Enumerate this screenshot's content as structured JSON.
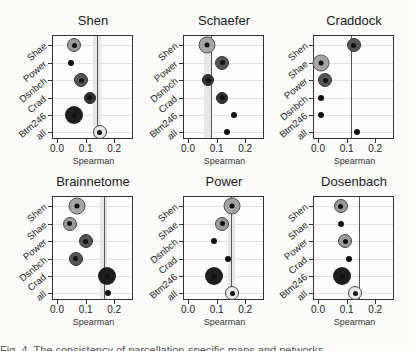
{
  "chart_data": [
    {
      "type": "scatter",
      "title": "Shen",
      "xlabel": "Spearman",
      "xlim": [
        -0.01,
        0.27
      ],
      "xticks": [
        "0.0",
        "0.1",
        "0.2"
      ],
      "categories": [
        "Shae",
        "Power",
        "Dsnbch",
        "Crad",
        "Btm246",
        "all"
      ],
      "values": [
        0.06,
        0.05,
        0.085,
        0.115,
        0.06,
        0.15
      ],
      "markers": [
        "ring",
        "small",
        "ringdark",
        "darkmed",
        "darklg",
        "open"
      ],
      "reference_line": 0.14,
      "band": [
        0.125,
        0.155
      ]
    },
    {
      "type": "scatter",
      "title": "Schaefer",
      "xlabel": "Spearman",
      "xlim": [
        -0.01,
        0.27
      ],
      "xticks": [
        "0.0",
        "0.1",
        "0.2"
      ],
      "categories": [
        "Shen",
        "Power",
        "Dsnbch",
        "Crad",
        "Btm246",
        "all"
      ],
      "values": [
        0.065,
        0.12,
        0.07,
        0.12,
        0.16,
        0.135
      ],
      "markers": [
        "ringbig",
        "ringdark",
        "darkmed",
        "darkmed",
        "small",
        "small"
      ],
      "reference_line": 0.08,
      "band": [
        0.055,
        0.08
      ]
    },
    {
      "type": "scatter",
      "title": "Craddock",
      "xlabel": "Spearman",
      "xlim": [
        -0.01,
        0.27
      ],
      "xticks": [
        "0.0",
        "0.1",
        "0.2"
      ],
      "categories": [
        "Shen",
        "Shae",
        "Power",
        "Dsnbch",
        "Btm246",
        "all"
      ],
      "values": [
        0.125,
        0.01,
        0.025,
        0.01,
        0.01,
        0.135
      ],
      "markers": [
        "ringdark",
        "ringbig",
        "ringdark",
        "small",
        "small",
        "small"
      ],
      "reference_line": 0.115,
      "band": null
    },
    {
      "type": "scatter",
      "title": "Brainnetome",
      "xlabel": "Spearman",
      "xlim": [
        -0.01,
        0.27
      ],
      "xticks": [
        "0.0",
        "0.1",
        "0.2"
      ],
      "categories": [
        "Shen",
        "Shae",
        "Power",
        "Dsnbch",
        "Crad",
        "all"
      ],
      "values": [
        0.07,
        0.045,
        0.1,
        0.065,
        0.175,
        0.18
      ],
      "markers": [
        "ringbig",
        "ring",
        "ringdark",
        "ringdark",
        "darklg",
        "small"
      ],
      "reference_line": 0.165,
      "band": [
        0.15,
        0.175
      ]
    },
    {
      "type": "scatter",
      "title": "Power",
      "xlabel": "Spearman",
      "xlim": [
        -0.01,
        0.27
      ],
      "xticks": [
        "0.0",
        "0.1",
        "0.2"
      ],
      "categories": [
        "Shen",
        "Shae",
        "Dsnbch",
        "Crad",
        "Btm246",
        "all"
      ],
      "values": [
        0.155,
        0.12,
        0.09,
        0.14,
        0.09,
        0.155
      ],
      "markers": [
        "ringbig",
        "ring",
        "small",
        "small",
        "darklg",
        "open"
      ],
      "reference_line": 0.15,
      "band": [
        0.14,
        0.165
      ]
    },
    {
      "type": "scatter",
      "title": "Dosenbach",
      "xlabel": "Spearman",
      "xlim": [
        -0.01,
        0.27
      ],
      "xticks": [
        "0.0",
        "0.1",
        "0.2"
      ],
      "categories": [
        "Shen",
        "Shae",
        "Power",
        "Crad",
        "Btm246",
        "all"
      ],
      "values": [
        0.08,
        0.08,
        0.095,
        0.11,
        0.085,
        0.13
      ],
      "markers": [
        "ring",
        "small",
        "ring",
        "small",
        "darklg",
        "open"
      ],
      "reference_line": 0.145,
      "band": null
    }
  ],
  "caption": "Fig. 4. The consistency of parcellation-specific maps and networks ..."
}
